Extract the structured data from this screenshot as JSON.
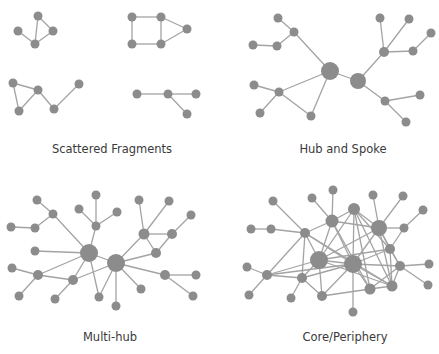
{
  "colors": {
    "node": "#8c8c8c",
    "edge": "#a3a3a3",
    "text": "#3a3a3a",
    "background": "#ffffff"
  },
  "panels": [
    {
      "id": "scattered",
      "label": "Scattered Fragments",
      "label_pos": [
        112,
        142
      ],
      "nodes": [
        [
          38,
          16,
          4.5
        ],
        [
          18,
          31,
          4.5
        ],
        [
          53,
          31,
          4.5
        ],
        [
          35,
          44,
          4.5
        ],
        [
          132,
          17,
          4.5
        ],
        [
          161,
          17,
          4.5
        ],
        [
          187,
          29,
          4.5
        ],
        [
          132,
          44,
          4.5
        ],
        [
          161,
          44,
          4.5
        ],
        [
          13,
          83,
          4.5
        ],
        [
          38,
          90,
          4.5
        ],
        [
          19,
          111,
          4.5
        ],
        [
          54,
          109,
          4.5
        ],
        [
          79,
          84,
          4.5
        ],
        [
          137,
          94,
          4.5
        ],
        [
          168,
          94,
          4.5
        ],
        [
          196,
          94,
          4.5
        ],
        [
          187,
          114,
          4.5
        ]
      ],
      "edges": [
        [
          0,
          3
        ],
        [
          0,
          2
        ],
        [
          2,
          3
        ],
        [
          1,
          3
        ],
        [
          4,
          5
        ],
        [
          4,
          7
        ],
        [
          5,
          8
        ],
        [
          7,
          8
        ],
        [
          5,
          6
        ],
        [
          6,
          8
        ],
        [
          9,
          10
        ],
        [
          9,
          11
        ],
        [
          10,
          11
        ],
        [
          10,
          12
        ],
        [
          12,
          13
        ],
        [
          14,
          15
        ],
        [
          15,
          16
        ],
        [
          15,
          17
        ]
      ]
    },
    {
      "id": "hub-spoke",
      "label": "Hub and Spoke",
      "label_pos": [
        343,
        142
      ],
      "nodes": [
        [
          330,
          71,
          9
        ],
        [
          358,
          81,
          8
        ],
        [
          278,
          18,
          4.5
        ],
        [
          294,
          32,
          4.5
        ],
        [
          253,
          45,
          4.5
        ],
        [
          277,
          46,
          4.5
        ],
        [
          279,
          92,
          4.5
        ],
        [
          254,
          85,
          4.5
        ],
        [
          260,
          113,
          4.5
        ],
        [
          311,
          116,
          4.5
        ],
        [
          384,
          52,
          5
        ],
        [
          380,
          18,
          4.5
        ],
        [
          409,
          19,
          4.5
        ],
        [
          431,
          33,
          4.5
        ],
        [
          413,
          51,
          4.5
        ],
        [
          385,
          101,
          4.5
        ],
        [
          420,
          95,
          4.5
        ],
        [
          406,
          122,
          4.5
        ]
      ],
      "edges": [
        [
          0,
          1
        ],
        [
          0,
          3
        ],
        [
          2,
          3
        ],
        [
          3,
          5
        ],
        [
          4,
          5
        ],
        [
          0,
          6
        ],
        [
          0,
          9
        ],
        [
          6,
          7
        ],
        [
          6,
          8
        ],
        [
          6,
          9
        ],
        [
          1,
          10
        ],
        [
          10,
          11
        ],
        [
          10,
          12
        ],
        [
          10,
          14
        ],
        [
          14,
          13
        ],
        [
          1,
          15
        ],
        [
          15,
          16
        ],
        [
          15,
          17
        ]
      ]
    },
    {
      "id": "multi-hub",
      "label": "Multi-hub",
      "label_pos": [
        110,
        330
      ],
      "nodes": [
        [
          89,
          253,
          9
        ],
        [
          116,
          263,
          9
        ],
        [
          37,
          200,
          4.5
        ],
        [
          53,
          214,
          4.5
        ],
        [
          11,
          227,
          4.5
        ],
        [
          35,
          228,
          4.5
        ],
        [
          96,
          195,
          4.5
        ],
        [
          79,
          209,
          4.5
        ],
        [
          117,
          212,
          4.5
        ],
        [
          96,
          226,
          4.5
        ],
        [
          139,
          200,
          4.5
        ],
        [
          169,
          201,
          4.5
        ],
        [
          191,
          215,
          4.5
        ],
        [
          144,
          234,
          5.5
        ],
        [
          172,
          234,
          5
        ],
        [
          156,
          253,
          5
        ],
        [
          35,
          251,
          4.5
        ],
        [
          12,
          268,
          4.5
        ],
        [
          38,
          275,
          5
        ],
        [
          19,
          296,
          4.5
        ],
        [
          73,
          280,
          5
        ],
        [
          55,
          299,
          4.5
        ],
        [
          99,
          297,
          4.5
        ],
        [
          116,
          306,
          4.5
        ],
        [
          141,
          289,
          4.5
        ],
        [
          165,
          275,
          5
        ],
        [
          196,
          275,
          4.5
        ],
        [
          193,
          296,
          4.5
        ]
      ],
      "edges": [
        [
          0,
          1
        ],
        [
          2,
          3
        ],
        [
          3,
          5
        ],
        [
          4,
          5
        ],
        [
          3,
          0
        ],
        [
          6,
          9
        ],
        [
          7,
          9
        ],
        [
          8,
          9
        ],
        [
          9,
          0
        ],
        [
          16,
          0
        ],
        [
          17,
          18
        ],
        [
          18,
          0
        ],
        [
          18,
          20
        ],
        [
          18,
          19
        ],
        [
          20,
          0
        ],
        [
          20,
          1
        ],
        [
          20,
          21
        ],
        [
          0,
          22
        ],
        [
          1,
          22
        ],
        [
          1,
          23
        ],
        [
          1,
          24
        ],
        [
          1,
          13
        ],
        [
          1,
          15
        ],
        [
          1,
          25
        ],
        [
          10,
          13
        ],
        [
          11,
          13
        ],
        [
          12,
          14
        ],
        [
          13,
          14
        ],
        [
          13,
          15
        ],
        [
          14,
          15
        ],
        [
          25,
          26
        ],
        [
          25,
          27
        ]
      ]
    },
    {
      "id": "core-periphery",
      "label": "Core/Periphery",
      "label_pos": [
        345,
        330
      ],
      "nodes": [
        [
          319,
          260,
          9
        ],
        [
          353,
          264,
          9
        ],
        [
          332,
          221,
          6.5
        ],
        [
          379,
          228,
          8
        ],
        [
          354,
          209,
          6
        ],
        [
          273,
          201,
          4.5
        ],
        [
          312,
          198,
          4.5
        ],
        [
          333,
          190,
          4.5
        ],
        [
          373,
          195,
          4.5
        ],
        [
          403,
          196,
          4.5
        ],
        [
          423,
          210,
          4.5
        ],
        [
          251,
          229,
          4.5
        ],
        [
          271,
          229,
          4.5
        ],
        [
          305,
          233,
          5
        ],
        [
          404,
          228,
          4.5
        ],
        [
          390,
          249,
          5
        ],
        [
          400,
          266,
          5
        ],
        [
          429,
          264,
          4.5
        ],
        [
          428,
          285,
          4.5
        ],
        [
          247,
          267,
          4.5
        ],
        [
          267,
          275,
          5
        ],
        [
          302,
          278,
          5
        ],
        [
          249,
          295,
          4.5
        ],
        [
          291,
          298,
          4.5
        ],
        [
          322,
          296,
          5
        ],
        [
          353,
          312,
          4.5
        ],
        [
          370,
          289,
          5.5
        ],
        [
          392,
          286,
          5.5
        ]
      ],
      "edges": [
        [
          0,
          1
        ],
        [
          0,
          2
        ],
        [
          0,
          4
        ],
        [
          0,
          13
        ],
        [
          0,
          20
        ],
        [
          0,
          21
        ],
        [
          0,
          24
        ],
        [
          0,
          15
        ],
        [
          0,
          3
        ],
        [
          0,
          27
        ],
        [
          1,
          2
        ],
        [
          1,
          4
        ],
        [
          1,
          3
        ],
        [
          1,
          15
        ],
        [
          1,
          16
        ],
        [
          1,
          25
        ],
        [
          1,
          26
        ],
        [
          1,
          27
        ],
        [
          1,
          13
        ],
        [
          1,
          21
        ],
        [
          1,
          20
        ],
        [
          1,
          24
        ],
        [
          2,
          4
        ],
        [
          2,
          7
        ],
        [
          2,
          6
        ],
        [
          2,
          13
        ],
        [
          2,
          26
        ],
        [
          2,
          3
        ],
        [
          4,
          3
        ],
        [
          4,
          27
        ],
        [
          4,
          15
        ],
        [
          4,
          26
        ],
        [
          3,
          8
        ],
        [
          3,
          9
        ],
        [
          3,
          14
        ],
        [
          3,
          15
        ],
        [
          3,
          27
        ],
        [
          3,
          16
        ],
        [
          14,
          10
        ],
        [
          14,
          15
        ],
        [
          15,
          16
        ],
        [
          15,
          27
        ],
        [
          16,
          17
        ],
        [
          16,
          18
        ],
        [
          16,
          27
        ],
        [
          16,
          26
        ],
        [
          5,
          13
        ],
        [
          11,
          12
        ],
        [
          12,
          13
        ],
        [
          13,
          20
        ],
        [
          13,
          21
        ],
        [
          13,
          27
        ],
        [
          19,
          20
        ],
        [
          20,
          22
        ],
        [
          20,
          21
        ],
        [
          21,
          23
        ],
        [
          21,
          24
        ],
        [
          24,
          26
        ],
        [
          26,
          27
        ]
      ]
    }
  ]
}
